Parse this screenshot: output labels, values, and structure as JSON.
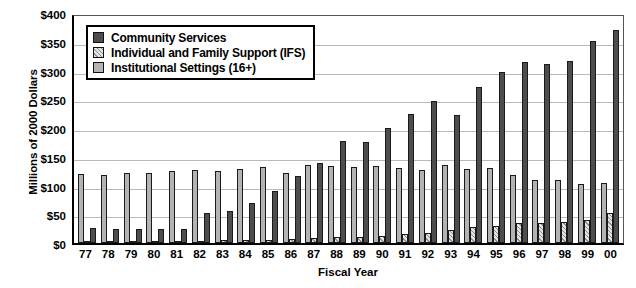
{
  "chart_data": {
    "type": "bar",
    "title": "",
    "xlabel": "Fiscal Year",
    "ylabel": "Millions of 2000 Dollars",
    "ylim": [
      0,
      400
    ],
    "ytick_labels": [
      "$400",
      "$350",
      "$300",
      "$250",
      "$200",
      "$150",
      "$100",
      "$50",
      "$0"
    ],
    "ytick_values": [
      400,
      350,
      300,
      250,
      200,
      150,
      100,
      50,
      0
    ],
    "grid": true,
    "legend_position": "top-left-inside",
    "categories": [
      "77",
      "78",
      "79",
      "80",
      "81",
      "82",
      "83",
      "84",
      "85",
      "86",
      "87",
      "88",
      "89",
      "90",
      "91",
      "92",
      "93",
      "94",
      "95",
      "96",
      "97",
      "98",
      "99",
      "00"
    ],
    "series": [
      {
        "name": "Institutional Settings (16+)",
        "key": "inst",
        "color": "#b3b3b3",
        "values": [
          120,
          118,
          121,
          122,
          126,
          127,
          125,
          128,
          133,
          122,
          136,
          134,
          132,
          134,
          130,
          127,
          135,
          129,
          130,
          119,
          109,
          110,
          103,
          104
        ]
      },
      {
        "name": "Individual and Family Support (IFS)",
        "key": "ifs",
        "color": "#e3e3e3",
        "values": [
          3,
          3,
          4,
          4,
          4,
          4,
          5,
          5,
          6,
          7,
          8,
          10,
          11,
          13,
          15,
          18,
          22,
          27,
          30,
          34,
          35,
          36,
          40,
          52
        ]
      },
      {
        "name": "Community Services",
        "key": "cs",
        "color": "#4d4d4d",
        "values": [
          26,
          25,
          25,
          25,
          24,
          52,
          55,
          70,
          91,
          117,
          140,
          177,
          176,
          200,
          224,
          247,
          222,
          272,
          298,
          314,
          311,
          316,
          351,
          371
        ]
      }
    ]
  },
  "legend": {
    "items": [
      {
        "label": "Community Services",
        "key": "cs"
      },
      {
        "label": "Individual and Family Support (IFS)",
        "key": "ifs"
      },
      {
        "label": "Institutional Settings (16+)",
        "key": "inst"
      }
    ]
  }
}
